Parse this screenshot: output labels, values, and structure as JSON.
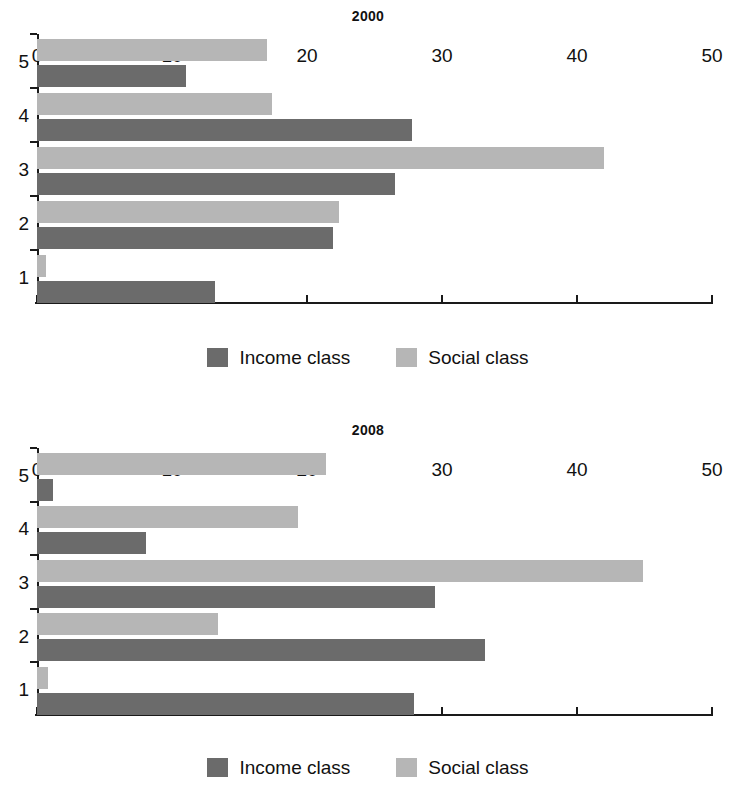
{
  "figure": {
    "legend": {
      "series": [
        {
          "key": "income",
          "label": "Income class",
          "color": "#6b6b6b"
        },
        {
          "key": "social",
          "label": "Social class",
          "color": "#b6b6b6"
        }
      ]
    }
  },
  "chart_data": [
    {
      "type": "bar",
      "orientation": "horizontal",
      "title": "2000",
      "xlabel": "",
      "ylabel": "",
      "categories": [
        "1",
        "2",
        "3",
        "4",
        "5"
      ],
      "xlim": [
        0,
        50
      ],
      "xticks": [
        0,
        10,
        20,
        30,
        40,
        50
      ],
      "xtick_labels": [
        "0",
        "10",
        "20",
        "30",
        "40",
        "50"
      ],
      "grid": false,
      "legend_position": "bottom",
      "series": [
        {
          "name": "Income class",
          "color": "#6b6b6b",
          "values": [
            13.2,
            21.9,
            26.5,
            27.8,
            11.0
          ]
        },
        {
          "name": "Social class",
          "color": "#b6b6b6",
          "values": [
            0.7,
            22.4,
            42.0,
            17.4,
            17.0
          ]
        }
      ]
    },
    {
      "type": "bar",
      "orientation": "horizontal",
      "title": "2008",
      "xlabel": "",
      "ylabel": "",
      "categories": [
        "1",
        "2",
        "3",
        "4",
        "5"
      ],
      "xlim": [
        0,
        50
      ],
      "xticks": [
        0,
        10,
        20,
        30,
        40,
        50
      ],
      "xtick_labels": [
        "0",
        "10",
        "20",
        "30",
        "40",
        "50"
      ],
      "grid": false,
      "legend_position": "bottom",
      "series": [
        {
          "name": "Income class",
          "color": "#6b6b6b",
          "values": [
            27.9,
            33.2,
            29.5,
            8.1,
            1.2
          ]
        },
        {
          "name": "Social class",
          "color": "#b6b6b6",
          "values": [
            0.8,
            13.4,
            44.9,
            19.3,
            21.4
          ]
        }
      ]
    }
  ]
}
